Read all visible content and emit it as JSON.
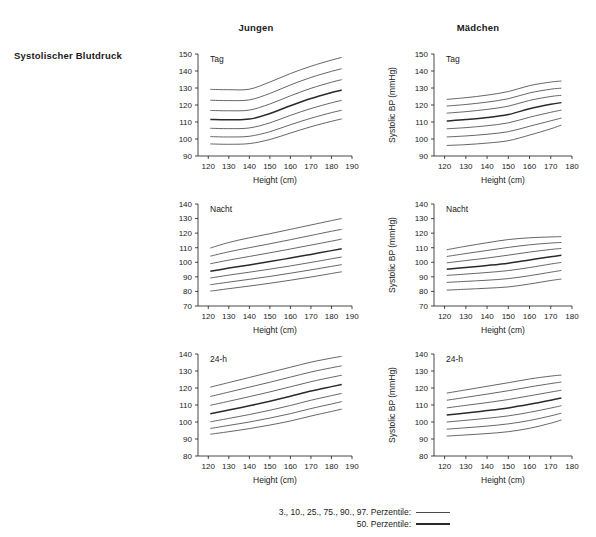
{
  "figure": {
    "row_label": "Systolischer Blutdruck",
    "column_headers": [
      "Jungen",
      "Mädchen"
    ]
  },
  "legend": {
    "outer_label": "3., 10., 25., 75., 90., 97. Perzentile:",
    "median_label": "50. Perzentile:"
  },
  "axis": {
    "xlabel": "Height (cm)",
    "ylabel": "Systolic BP (mmHg)"
  },
  "chart_data": [
    {
      "id": "boys-tag",
      "type": "line",
      "title": "Tag",
      "group": "Jungen",
      "xlabel": "Height (cm)",
      "ylabel": "",
      "xlim": [
        115,
        190
      ],
      "ylim": [
        90,
        150
      ],
      "xticks": [
        120,
        130,
        140,
        150,
        160,
        170,
        180,
        190
      ],
      "yticks": [
        90,
        100,
        110,
        120,
        130,
        140,
        150
      ],
      "grid": false,
      "x": [
        121,
        130,
        140,
        150,
        160,
        170,
        180,
        185
      ],
      "series": [
        {
          "name": "97. Perzentile",
          "style": "outer",
          "values": [
            129.2,
            129.0,
            129.3,
            133.5,
            138.5,
            142.8,
            146.4,
            148.0
          ]
        },
        {
          "name": "90. Perzentile",
          "style": "outer",
          "values": [
            122.8,
            122.6,
            123.0,
            126.8,
            131.8,
            136.2,
            139.8,
            141.3
          ]
        },
        {
          "name": "75. Perzentile",
          "style": "outer",
          "values": [
            116.8,
            116.6,
            117.0,
            120.6,
            125.4,
            129.8,
            133.4,
            134.9
          ]
        },
        {
          "name": "50. Perzentile",
          "style": "median",
          "values": [
            111.5,
            111.3,
            111.7,
            115.0,
            119.6,
            123.8,
            127.3,
            128.8
          ]
        },
        {
          "name": "25. Perzentile",
          "style": "outer",
          "values": [
            106.3,
            106.1,
            106.5,
            109.5,
            113.9,
            117.9,
            121.3,
            122.7
          ]
        },
        {
          "name": "10. Perzentile",
          "style": "outer",
          "values": [
            101.4,
            101.2,
            101.6,
            104.3,
            108.4,
            112.2,
            115.5,
            116.9
          ]
        },
        {
          "name": "3. Perzentile",
          "style": "outer",
          "values": [
            97.1,
            96.9,
            97.3,
            99.7,
            103.5,
            107.2,
            110.4,
            111.8
          ]
        }
      ]
    },
    {
      "id": "girls-tag",
      "type": "line",
      "title": "Tag",
      "group": "Mädchen",
      "xlabel": "Height (cm)",
      "ylabel": "Systolic BP (mmHg)",
      "xlim": [
        115,
        180
      ],
      "ylim": [
        90,
        150
      ],
      "xticks": [
        120,
        130,
        140,
        150,
        160,
        170,
        180
      ],
      "yticks": [
        90,
        100,
        110,
        120,
        130,
        140,
        150
      ],
      "grid": false,
      "x": [
        121,
        130,
        140,
        150,
        160,
        170,
        175
      ],
      "series": [
        {
          "name": "97. Perzentile",
          "style": "outer",
          "values": [
            123.3,
            124.3,
            125.8,
            127.9,
            131.4,
            133.5,
            134.1
          ]
        },
        {
          "name": "90. Perzentile",
          "style": "outer",
          "values": [
            119.4,
            120.3,
            121.7,
            123.7,
            127.1,
            129.3,
            129.9
          ]
        },
        {
          "name": "75. Perzentile",
          "style": "outer",
          "values": [
            115.2,
            116.1,
            117.4,
            119.3,
            122.7,
            125.0,
            125.7
          ]
        },
        {
          "name": "50. Perzentile",
          "style": "median",
          "values": [
            110.6,
            111.4,
            112.6,
            114.4,
            117.8,
            120.4,
            121.4
          ]
        },
        {
          "name": "25. Perzentile",
          "style": "outer",
          "values": [
            106.0,
            106.7,
            107.8,
            109.5,
            112.8,
            115.7,
            117.0
          ]
        },
        {
          "name": "10. Perzentile",
          "style": "outer",
          "values": [
            101.2,
            101.8,
            102.8,
            104.3,
            107.5,
            110.7,
            112.3
          ]
        },
        {
          "name": "3. Perzentile",
          "style": "outer",
          "values": [
            96.2,
            96.7,
            97.6,
            99.0,
            102.3,
            106.0,
            108.2
          ]
        }
      ]
    },
    {
      "id": "boys-nacht",
      "type": "line",
      "title": "Nacht",
      "group": "Jungen",
      "xlabel": "Height (cm)",
      "ylabel": "",
      "xlim": [
        115,
        190
      ],
      "ylim": [
        70,
        140
      ],
      "xticks": [
        120,
        130,
        140,
        150,
        160,
        170,
        180,
        190
      ],
      "yticks": [
        70,
        80,
        90,
        100,
        110,
        120,
        130,
        140
      ],
      "grid": false,
      "x": [
        121,
        130,
        140,
        150,
        160,
        170,
        180,
        185
      ],
      "series": [
        {
          "name": "97. Perzentile",
          "style": "outer",
          "values": [
            109.8,
            113.6,
            116.8,
            119.6,
            122.6,
            125.6,
            128.6,
            130.0
          ]
        },
        {
          "name": "90. Perzentile",
          "style": "outer",
          "values": [
            104.2,
            107.2,
            110.0,
            112.7,
            115.5,
            118.4,
            121.3,
            122.6
          ]
        },
        {
          "name": "75. Perzentile",
          "style": "outer",
          "values": [
            99.0,
            101.5,
            104.0,
            106.5,
            109.1,
            111.8,
            114.5,
            115.9
          ]
        },
        {
          "name": "50. Perzentile",
          "style": "median",
          "values": [
            93.8,
            96.0,
            98.2,
            100.5,
            102.9,
            105.4,
            108.0,
            109.3
          ]
        },
        {
          "name": "25. Perzentile",
          "style": "outer",
          "values": [
            89.2,
            91.2,
            93.2,
            95.3,
            97.5,
            99.9,
            102.4,
            103.6
          ]
        },
        {
          "name": "10. Perzentile",
          "style": "outer",
          "values": [
            84.6,
            86.4,
            88.3,
            90.3,
            92.5,
            94.8,
            97.2,
            98.4
          ]
        },
        {
          "name": "3. Perzentile",
          "style": "outer",
          "values": [
            80.2,
            81.9,
            83.7,
            85.6,
            87.7,
            89.9,
            92.3,
            93.5
          ]
        }
      ]
    },
    {
      "id": "girls-nacht",
      "type": "line",
      "title": "Nacht",
      "group": "Mädchen",
      "xlabel": "Height (cm)",
      "ylabel": "Systolic BP (mmHg)",
      "xlim": [
        115,
        180
      ],
      "ylim": [
        70,
        140
      ],
      "xticks": [
        120,
        130,
        140,
        150,
        160,
        170,
        180
      ],
      "yticks": [
        70,
        80,
        90,
        100,
        110,
        120,
        130,
        140
      ],
      "grid": false,
      "x": [
        121,
        130,
        140,
        150,
        160,
        170,
        175
      ],
      "series": [
        {
          "name": "97. Perzentile",
          "style": "outer",
          "values": [
            108.6,
            111.0,
            113.4,
            115.6,
            116.8,
            117.4,
            117.6
          ]
        },
        {
          "name": "90. Perzentile",
          "style": "outer",
          "values": [
            104.0,
            106.0,
            108.1,
            110.2,
            112.0,
            113.2,
            113.6
          ]
        },
        {
          "name": "75. Perzentile",
          "style": "outer",
          "values": [
            99.6,
            101.2,
            102.9,
            104.9,
            107.0,
            108.8,
            109.5
          ]
        },
        {
          "name": "50. Perzentile",
          "style": "median",
          "values": [
            95.2,
            96.4,
            97.8,
            99.4,
            101.6,
            103.8,
            104.8
          ]
        },
        {
          "name": "25. Perzentile",
          "style": "outer",
          "values": [
            91.0,
            91.9,
            93.0,
            94.3,
            96.4,
            98.8,
            99.9
          ]
        },
        {
          "name": "10. Perzentile",
          "style": "outer",
          "values": [
            86.2,
            86.9,
            87.7,
            88.8,
            90.8,
            93.2,
            94.4
          ]
        },
        {
          "name": "3. Perzentile",
          "style": "outer",
          "values": [
            80.9,
            81.5,
            82.2,
            83.1,
            85.1,
            87.5,
            88.5
          ]
        }
      ]
    },
    {
      "id": "boys-24h",
      "type": "line",
      "title": "24-h",
      "group": "Jungen",
      "xlabel": "Height (cm)",
      "ylabel": "",
      "xlim": [
        115,
        190
      ],
      "ylim": [
        80,
        140
      ],
      "xticks": [
        120,
        130,
        140,
        150,
        160,
        170,
        180,
        190
      ],
      "yticks": [
        80,
        90,
        100,
        110,
        120,
        130,
        140
      ],
      "grid": false,
      "x": [
        121,
        130,
        140,
        150,
        160,
        170,
        180,
        185
      ],
      "series": [
        {
          "name": "97. Perzentile",
          "style": "outer",
          "values": [
            120.5,
            123.2,
            126.2,
            129.2,
            132.2,
            135.2,
            137.6,
            138.6
          ]
        },
        {
          "name": "90. Perzentile",
          "style": "outer",
          "values": [
            115.0,
            117.6,
            120.5,
            123.4,
            126.4,
            129.4,
            131.9,
            133.0
          ]
        },
        {
          "name": "75. Perzentile",
          "style": "outer",
          "values": [
            109.8,
            112.2,
            114.9,
            117.7,
            120.7,
            123.7,
            126.3,
            127.5
          ]
        },
        {
          "name": "50. Perzentile",
          "style": "median",
          "values": [
            104.8,
            107.0,
            109.5,
            112.2,
            115.1,
            118.2,
            120.8,
            122.1
          ]
        },
        {
          "name": "25. Perzentile",
          "style": "outer",
          "values": [
            100.1,
            102.1,
            104.4,
            106.9,
            109.7,
            112.8,
            115.5,
            116.8
          ]
        },
        {
          "name": "10. Perzentile",
          "style": "outer",
          "values": [
            96.2,
            98.0,
            100.0,
            102.3,
            104.9,
            107.9,
            110.6,
            112.0
          ]
        },
        {
          "name": "3. Perzentile",
          "style": "outer",
          "values": [
            92.8,
            94.3,
            96.1,
            98.2,
            100.6,
            103.5,
            106.2,
            107.6
          ]
        }
      ]
    },
    {
      "id": "girls-24h",
      "type": "line",
      "title": "24-h",
      "group": "Mädchen",
      "xlabel": "Height (cm)",
      "ylabel": "Systolic BP (mmHg)",
      "xlim": [
        115,
        180
      ],
      "ylim": [
        80,
        140
      ],
      "xticks": [
        120,
        130,
        140,
        150,
        160,
        170,
        180
      ],
      "yticks": [
        80,
        90,
        100,
        110,
        120,
        130,
        140
      ],
      "grid": false,
      "x": [
        121,
        130,
        140,
        150,
        160,
        170,
        175
      ],
      "series": [
        {
          "name": "97. Perzentile",
          "style": "outer",
          "values": [
            117.0,
            118.9,
            121.0,
            123.1,
            125.3,
            127.0,
            127.6
          ]
        },
        {
          "name": "90. Perzentile",
          "style": "outer",
          "values": [
            112.8,
            114.5,
            116.4,
            118.4,
            120.6,
            122.6,
            123.5
          ]
        },
        {
          "name": "75. Perzentile",
          "style": "outer",
          "values": [
            108.3,
            109.8,
            111.4,
            113.2,
            115.4,
            117.6,
            118.7
          ]
        },
        {
          "name": "50. Perzentile",
          "style": "median",
          "values": [
            104.1,
            105.3,
            106.7,
            108.3,
            110.4,
            112.8,
            114.1
          ]
        },
        {
          "name": "25. Perzentile",
          "style": "outer",
          "values": [
            100.0,
            101.0,
            102.2,
            103.6,
            105.7,
            108.2,
            109.6
          ]
        },
        {
          "name": "10. Perzentile",
          "style": "outer",
          "values": [
            95.8,
            96.6,
            97.6,
            98.9,
            100.9,
            103.6,
            105.2
          ]
        },
        {
          "name": "3. Perzentile",
          "style": "outer",
          "values": [
            91.7,
            92.4,
            93.2,
            94.3,
            96.3,
            99.3,
            101.2
          ]
        }
      ]
    }
  ]
}
